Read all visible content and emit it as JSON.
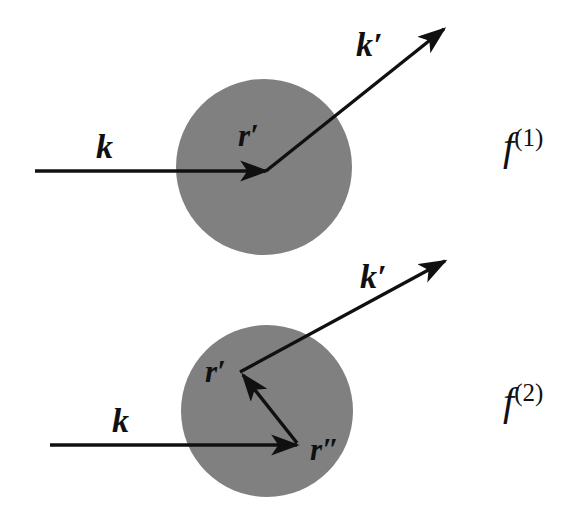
{
  "figure": {
    "background_color": "#ffffff",
    "stroke_color": "#101010",
    "target_fill_color": "#808080"
  },
  "diagrams": [
    {
      "id": "first-order",
      "amplitude_label": "f",
      "amplitude_order": "(1)",
      "target": {
        "cx": 264,
        "cy": 167,
        "r": 88
      },
      "incoming": {
        "label": "k",
        "label_x": 96,
        "label_y": 158,
        "x1": 35,
        "y1": 171,
        "x2": 266,
        "y2": 171
      },
      "outgoing": {
        "label": "k′",
        "label_x": 356,
        "label_y": 56,
        "x1": 266,
        "y1": 171,
        "x2": 447,
        "y2": 26
      },
      "points": [
        {
          "label": "r′",
          "label_x": 238,
          "label_y": 146
        }
      ]
    },
    {
      "id": "second-order",
      "amplitude_label": "f",
      "amplitude_order": "(2)",
      "target": {
        "cx": 267,
        "cy": 411,
        "r": 86
      },
      "incoming": {
        "label": "k",
        "label_x": 112,
        "label_y": 432,
        "x1": 50,
        "y1": 445,
        "x2": 297,
        "y2": 445
      },
      "outgoing": {
        "label": "k′",
        "label_x": 360,
        "label_y": 288,
        "x1": 240,
        "y1": 372,
        "x2": 448,
        "y2": 258
      },
      "internal": {
        "x1": 296,
        "y1": 443,
        "x2": 240,
        "y2": 372
      },
      "points": [
        {
          "label": "r′",
          "label_x": 205,
          "label_y": 382
        },
        {
          "label": "r″",
          "label_x": 310,
          "label_y": 460
        }
      ]
    }
  ]
}
